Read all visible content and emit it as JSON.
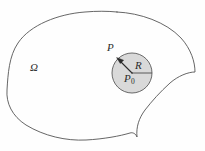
{
  "figure": {
    "kind": "math-diagram",
    "background_color": "#fefefe",
    "outline": {
      "stroke_color": "#555555",
      "stroke_width": 0.9,
      "fill_color": "none"
    },
    "disk": {
      "center_x": 132,
      "center_y": 73,
      "radius": 20,
      "fill_color": "#d9d9d9",
      "stroke_color": "#5a5a5a",
      "stroke_width": 0.9
    },
    "radius_line": {
      "stroke_color": "#4a4a4a",
      "stroke_width": 0.9,
      "from_x": 132,
      "from_y": 73,
      "to_x": 152,
      "to_y": 73
    },
    "arrow": {
      "stroke_color": "#2b2b2b",
      "stroke_width": 1.1,
      "from_x": 132,
      "from_y": 73,
      "to_x": 118,
      "to_y": 59
    },
    "labels": {
      "region": "Ω",
      "point_on_boundary": "P",
      "radius": "R",
      "center_point_base": "P",
      "center_point_subscript": "0"
    }
  }
}
